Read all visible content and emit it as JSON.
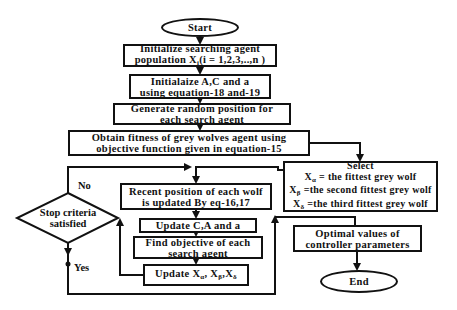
{
  "flowchart": {
    "start": "Start",
    "init_population": {
      "line1": "Initialize searching agent",
      "line2_prefix": "population X",
      "line2_sub": "i",
      "line2_suffix": "(i = 1,2,3,..,n )"
    },
    "init_params": "Initialaize A,C and a using equation-18 and-19",
    "generate_random": "Generate random position for each search agent",
    "obtain_fitness": "Obtain fitness of grey wolves agent using objective function given in equation-15",
    "select": {
      "title": "Select",
      "alpha_symbol": "X",
      "alpha_sub": "α",
      "alpha_text": " = the fittest grey wolf",
      "beta_symbol": "X",
      "beta_sub": "β",
      "beta_text": " =the second fittest grey wolf",
      "delta_symbol": "X",
      "delta_sub": "δ",
      "delta_text": " =the third  fittest grey wolf"
    },
    "recent_position": "Recent position of each wolf is updated By eq-16,17",
    "update_cal": "Update C,A and a",
    "find_objective": "Find objective of each search agent",
    "update_x": {
      "prefix": "Update X",
      "sub1": "α",
      "sep1": ", X",
      "sub2": "β",
      "sep2": ",X",
      "sub3": "δ"
    },
    "decision": "Stop criteria satisfied",
    "no_label": "No",
    "yes_label": "Yes",
    "optimal": "Optimal values of controller parameters",
    "end": "End"
  }
}
